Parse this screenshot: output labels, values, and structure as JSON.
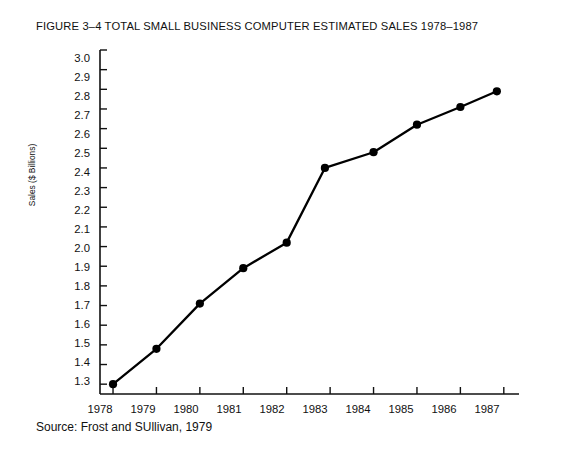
{
  "figure": {
    "title": "FIGURE 3–4 TOTAL SMALL BUSINESS COMPUTER ESTIMATED SALES 1978–1987",
    "source": "Source: Frost and SUllivan, 1979"
  },
  "axes": {
    "y_title": "Sales ($ Billions)",
    "y_ticks": [
      "3.0",
      "2.9",
      "2.8",
      "2.7",
      "2.6",
      "2.5",
      "2.4",
      "2.3",
      "2.2",
      "2.1",
      "2.0",
      "1.9",
      "1.8",
      "1.7",
      "1.6",
      "1.5",
      "1.4",
      "1.3"
    ],
    "x_ticks": [
      "1978",
      "1979",
      "1980",
      "1981",
      "1982",
      "1983",
      "1984",
      "1985",
      "1986",
      "1987"
    ]
  },
  "chart_data": {
    "type": "line",
    "title": "FIGURE 3–4 TOTAL SMALL BUSINESS COMPUTER ESTIMATED SALES 1978–1987",
    "subtitle": "",
    "xlabel": "",
    "ylabel": "Sales ($ Billions)",
    "categories": [
      "1978",
      "1979",
      "1980",
      "1981",
      "1982",
      "1983",
      "1984",
      "1985",
      "1986",
      "1987"
    ],
    "x": [
      1978,
      1979,
      1980,
      1981,
      1982,
      1983,
      1984,
      1985,
      1986,
      1987
    ],
    "values": [
      1.3,
      1.48,
      1.71,
      1.89,
      2.02,
      2.4,
      2.48,
      2.62,
      2.71,
      2.79
    ],
    "series": [
      {
        "name": "Total small business computer estimated sales",
        "values": [
          1.3,
          1.48,
          1.71,
          1.89,
          2.02,
          2.4,
          2.48,
          2.62,
          2.71,
          2.79
        ]
      }
    ],
    "point_x_offsets_years": [
      0,
      0,
      0,
      0,
      0,
      -0.12,
      0,
      0,
      0,
      -0.16
    ],
    "ylim": [
      1.25,
      3.0
    ],
    "xlim": [
      1977.7,
      1987.35
    ],
    "ytick_step": 0.1,
    "grid": false,
    "legend": false,
    "legend_position": "none",
    "marker": "circle",
    "line_color": "#000000",
    "marker_color": "#000000",
    "background_color": "#ffffff",
    "annotations": [
      "Source: Frost and SUllivan, 1979"
    ]
  }
}
